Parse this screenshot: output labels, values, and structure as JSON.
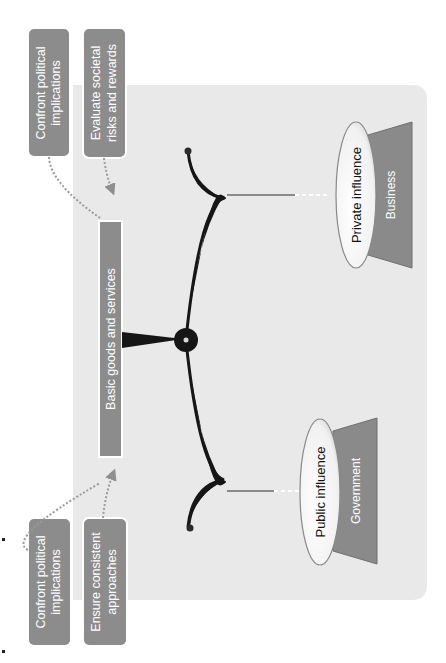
{
  "diagram": {
    "orientation": "rotated-90-ccw",
    "center_label": "Basic goods and services",
    "policy_boxes": [
      {
        "id": "confront",
        "label_lines": [
          "Confront political",
          "implications"
        ]
      },
      {
        "id": "evaluate",
        "label_lines": [
          "Evaluate societal",
          "risks and rewards"
        ]
      },
      {
        "id": "encourage",
        "label_lines": [
          "Encourage",
          "broad access"
        ]
      },
      {
        "id": "ensure",
        "label_lines": [
          "Ensure consistent",
          "approaches"
        ]
      }
    ],
    "left_pan": {
      "influence": "Public influence",
      "sector": "Government"
    },
    "right_pan": {
      "influence": "Private influence",
      "sector": "Business"
    }
  },
  "colors": {
    "panel_bg": "#e9e9e9",
    "box_fill": "#8c8c8c",
    "box_text": "#ffffff",
    "beam": "#161616",
    "sector_fill": "#8a8a8a",
    "ellipse_fill": "#f7f7f7",
    "string": "#8a8a8a",
    "arrow": "#9a9a9a"
  }
}
